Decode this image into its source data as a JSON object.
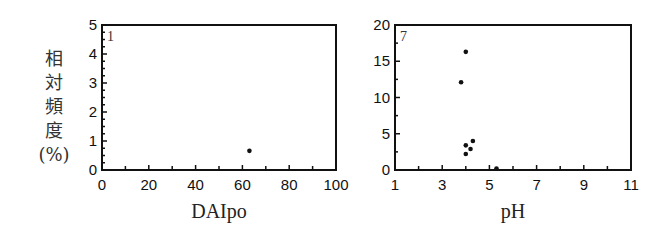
{
  "chart_data": [
    {
      "type": "scatter",
      "panel_label": "1",
      "title": "",
      "xlabel": "DAIpo",
      "ylabel": "相対頻度(%)",
      "xlim": [
        0,
        100
      ],
      "ylim": [
        0,
        5
      ],
      "x_ticks": [
        0,
        20,
        40,
        60,
        80,
        100
      ],
      "y_ticks": [
        0,
        1,
        2,
        3,
        4,
        5
      ],
      "grid": false,
      "points": [
        {
          "x": 63,
          "y": 0.66
        }
      ]
    },
    {
      "type": "scatter",
      "panel_label": "7",
      "title": "",
      "xlabel": "pH",
      "ylabel": "",
      "xlim": [
        1,
        11
      ],
      "ylim": [
        0,
        20
      ],
      "x_ticks": [
        1,
        3,
        5,
        7,
        9,
        11
      ],
      "y_ticks": [
        0,
        5,
        10,
        15,
        20
      ],
      "grid": false,
      "points": [
        {
          "x": 4.0,
          "y": 16.3
        },
        {
          "x": 3.8,
          "y": 12.1
        },
        {
          "x": 4.3,
          "y": 4.0
        },
        {
          "x": 4.0,
          "y": 3.4
        },
        {
          "x": 4.2,
          "y": 2.9
        },
        {
          "x": 4.0,
          "y": 2.2
        },
        {
          "x": 5.3,
          "y": 0.2
        }
      ]
    }
  ],
  "ylabel_chars": [
    "相",
    "対",
    "頻",
    "度",
    "(%)"
  ]
}
